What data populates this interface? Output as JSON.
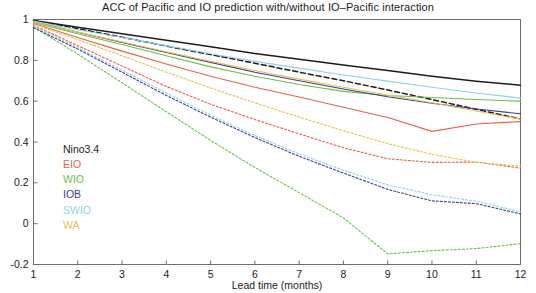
{
  "chart_data": {
    "type": "line",
    "title": "ACC of Pacific and IO prediction with/without IO–Pacific interaction",
    "xlabel": "Lead time (months)",
    "ylabel": "",
    "x": [
      1,
      2,
      3,
      4,
      5,
      6,
      7,
      8,
      9,
      10,
      11,
      12
    ],
    "xlim": [
      1,
      12
    ],
    "ylim": [
      -0.2,
      1.0
    ],
    "xticks": [
      "1",
      "2",
      "3",
      "4",
      "5",
      "6",
      "7",
      "8",
      "9",
      "10",
      "11",
      "12"
    ],
    "yticks": [
      "1",
      "0.8",
      "0.6",
      "0.4",
      "0.2",
      "0",
      "-0.2"
    ],
    "ytick_values": [
      1,
      0.8,
      0.6,
      0.4,
      0.2,
      0,
      -0.2
    ],
    "grid": false,
    "legend_position": "lower-left-inside",
    "linestyle_meaning": {
      "solid": "with IO-Pacific interaction",
      "dashed": "without IO-Pacific interaction"
    },
    "colors": {
      "Nino3.4": "#1c1c1c",
      "EIO": "#e8604c",
      "WIO": "#6cbf4a",
      "IOB": "#3a3f8f",
      "SWIO": "#8fd4e8",
      "WA": "#e8c04a"
    },
    "series": [
      {
        "name": "Nino3.4",
        "label": "Nino3.4",
        "color": "#1c1c1c",
        "style": "solid",
        "values": [
          0.995,
          0.962,
          0.93,
          0.898,
          0.866,
          0.834,
          0.805,
          0.777,
          0.75,
          0.722,
          0.698,
          0.678
        ]
      },
      {
        "name": "Nino3.4_no_interaction",
        "label": "Nino3.4",
        "color": "#1c1c1c",
        "style": "dashed",
        "values": [
          0.995,
          0.955,
          0.913,
          0.87,
          0.828,
          0.786,
          0.742,
          0.7,
          0.655,
          0.608,
          0.56,
          0.513
        ]
      },
      {
        "name": "EIO",
        "label": "EIO",
        "color": "#e8604c",
        "style": "solid",
        "values": [
          0.98,
          0.912,
          0.845,
          0.782,
          0.722,
          0.668,
          0.62,
          0.57,
          0.52,
          0.452,
          0.488,
          0.5
        ]
      },
      {
        "name": "EIO_no_interaction",
        "label": "EIO",
        "color": "#e8604c",
        "style": "dashed",
        "values": [
          0.972,
          0.872,
          0.772,
          0.672,
          0.585,
          0.51,
          0.44,
          0.372,
          0.318,
          0.3,
          0.302,
          0.272
        ]
      },
      {
        "name": "WIO",
        "label": "WIO",
        "color": "#6cbf4a",
        "style": "solid",
        "values": [
          0.985,
          0.93,
          0.878,
          0.822,
          0.768,
          0.722,
          0.682,
          0.648,
          0.628,
          0.618,
          0.608,
          0.6
        ]
      },
      {
        "name": "WIO_no_interaction",
        "label": "WIO",
        "color": "#6cbf4a",
        "style": "dashed",
        "values": [
          0.965,
          0.83,
          0.69,
          0.548,
          0.408,
          0.275,
          0.152,
          0.028,
          -0.148,
          -0.132,
          -0.122,
          -0.098
        ]
      },
      {
        "name": "IOB",
        "label": "IOB",
        "color": "#3a3f8f",
        "style": "solid",
        "values": [
          0.99,
          0.938,
          0.888,
          0.838,
          0.79,
          0.742,
          0.7,
          0.66,
          0.622,
          0.59,
          0.562,
          0.538
        ]
      },
      {
        "name": "IOB_no_interaction",
        "label": "IOB",
        "color": "#3a3f8f",
        "style": "dashed",
        "values": [
          0.96,
          0.855,
          0.742,
          0.628,
          0.522,
          0.422,
          0.33,
          0.248,
          0.168,
          0.112,
          0.098,
          0.048
        ]
      },
      {
        "name": "SWIO",
        "label": "SWIO",
        "color": "#8fd4e8",
        "style": "solid",
        "values": [
          0.992,
          0.95,
          0.912,
          0.872,
          0.832,
          0.795,
          0.762,
          0.728,
          0.698,
          0.668,
          0.64,
          0.615
        ]
      },
      {
        "name": "SWIO_no_interaction",
        "label": "SWIO",
        "color": "#8fd4e8",
        "style": "dashed",
        "values": [
          0.968,
          0.862,
          0.752,
          0.64,
          0.532,
          0.432,
          0.342,
          0.262,
          0.19,
          0.142,
          0.11,
          0.058
        ]
      },
      {
        "name": "WA",
        "label": "WA",
        "color": "#e8c04a",
        "style": "solid",
        "values": [
          0.988,
          0.938,
          0.89,
          0.842,
          0.795,
          0.75,
          0.708,
          0.668,
          0.63,
          0.592,
          0.552,
          0.512
        ]
      },
      {
        "name": "WA_no_interaction",
        "label": "WA",
        "color": "#e8c04a",
        "style": "dashed",
        "values": [
          0.978,
          0.902,
          0.822,
          0.742,
          0.665,
          0.592,
          0.522,
          0.455,
          0.392,
          0.34,
          0.3,
          0.282
        ]
      }
    ],
    "legend": [
      {
        "label": "Nino3.4",
        "color": "#1c1c1c"
      },
      {
        "label": "EIO",
        "color": "#e8604c"
      },
      {
        "label": "WIO",
        "color": "#6cbf4a"
      },
      {
        "label": "IOB",
        "color": "#3a3f8f"
      },
      {
        "label": "SWIO",
        "color": "#8fd4e8"
      },
      {
        "label": "WA",
        "color": "#e8c04a"
      }
    ]
  }
}
